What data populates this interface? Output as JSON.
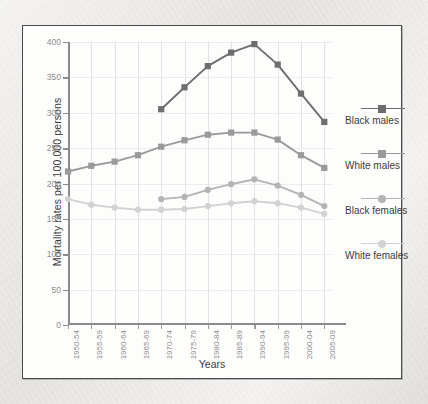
{
  "chart_data": {
    "type": "line",
    "title": "",
    "xlabel": "Years",
    "ylabel": "Mortality rates per 100,000 persons",
    "ylim": [
      0,
      400
    ],
    "yticks": [
      0,
      50,
      100,
      150,
      200,
      250,
      300,
      350,
      400
    ],
    "grid": true,
    "legend_position": "right",
    "categories": [
      "1950-54",
      "1955-59",
      "1960-64",
      "1965-69",
      "1970-74",
      "1975-79",
      "1980-84",
      "1985-89",
      "1990-94",
      "1995-99",
      "2000-04",
      "2005-09"
    ],
    "series": [
      {
        "name": "Black males",
        "color": "#6e6e6e",
        "marker": "square",
        "values": [
          null,
          null,
          null,
          null,
          305,
          336,
          366,
          385,
          397,
          368,
          327,
          287
        ]
      },
      {
        "name": "White males",
        "color": "#9a9a9a",
        "marker": "square",
        "values": [
          217,
          225,
          231,
          240,
          252,
          261,
          269,
          272,
          272,
          262,
          240,
          222
        ]
      },
      {
        "name": "Black females",
        "color": "#b4b4b4",
        "marker": "round",
        "values": [
          null,
          null,
          null,
          null,
          178,
          181,
          191,
          199,
          206,
          197,
          184,
          168
        ]
      },
      {
        "name": "White females",
        "color": "#d2d2d2",
        "marker": "round",
        "values": [
          178,
          170,
          166,
          163,
          163,
          164,
          168,
          172,
          175,
          172,
          166,
          157
        ]
      }
    ]
  },
  "axes": {
    "y_title": "Mortality rates per 100,000 persons",
    "x_title": "Years"
  }
}
